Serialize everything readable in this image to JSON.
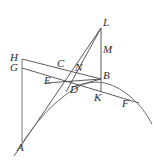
{
  "figure": {
    "kind": "geometric-construction-diagram",
    "background_color": "#ffffff",
    "stroke_color": "#4a4a4a",
    "label_color": "#2b2b2b",
    "width": 158,
    "height": 165,
    "points": [
      {
        "id": "A",
        "label": "A",
        "x": 18,
        "y": 150,
        "label_x": 17,
        "label_y": 147
      },
      {
        "id": "B",
        "label": "B",
        "x": 101,
        "y": 79,
        "label_x": 103,
        "label_y": 73
      },
      {
        "id": "C",
        "label": "C",
        "x": 63,
        "y": 69,
        "label_x": 58,
        "label_y": 61
      },
      {
        "id": "D",
        "label": "D",
        "x": 76,
        "y": 85,
        "label_x": 71,
        "label_y": 86
      },
      {
        "id": "E",
        "label": "E",
        "x": 55,
        "y": 78,
        "label_x": 45,
        "label_y": 78
      },
      {
        "id": "F",
        "label": "F",
        "x": 131,
        "y": 99,
        "label_x": 123,
        "label_y": 100
      },
      {
        "id": "G",
        "label": "G",
        "x": 22,
        "y": 68,
        "label_x": 10,
        "label_y": 62
      },
      {
        "id": "H",
        "label": "H",
        "x": 22,
        "y": 59,
        "label_x": 10,
        "label_y": 52
      },
      {
        "id": "K",
        "label": "K",
        "x": 101,
        "y": 90,
        "label_x": 96,
        "label_y": 94
      },
      {
        "id": "L",
        "label": "L",
        "x": 101,
        "y": 28,
        "label_x": 104,
        "label_y": 19
      },
      {
        "id": "M",
        "label": "M",
        "x": 79,
        "y": 72,
        "label_x": 76,
        "label_y": 64
      },
      {
        "id": "N",
        "label": "N",
        "x": 101,
        "y": 55,
        "label_x": 104,
        "label_y": 47
      }
    ],
    "segments": [
      {
        "name": "segment-H-A",
        "from": "H",
        "to": "A-vertical"
      },
      {
        "name": "segment-G-A",
        "from": "G",
        "to": "A-vertical"
      },
      {
        "name": "segment-H-B",
        "from": "H",
        "to": "B"
      },
      {
        "name": "segment-G-F",
        "from": "G",
        "to": "F"
      },
      {
        "name": "segment-A-L",
        "from": "A",
        "to": "L"
      },
      {
        "name": "segment-D-L",
        "from": "D",
        "to": "L"
      },
      {
        "name": "segment-L-K",
        "from": "L",
        "to": "K"
      },
      {
        "name": "segment-E-B",
        "from": "E",
        "to": "B"
      },
      {
        "name": "segment-D-B",
        "from": "D",
        "to": "B"
      }
    ],
    "curve": {
      "name": "parabolic-arc-A-D-F",
      "description": "smooth curve rising from A through D and B region to F and beyond right edge"
    }
  }
}
